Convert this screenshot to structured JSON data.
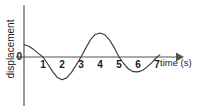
{
  "figure": {
    "kind": "line-graph",
    "background_color": "#ffffff",
    "curve_color": "#3a3a3a",
    "axis_color": "#555555",
    "text_color": "#1b1b1b"
  },
  "labels": {
    "origin": "0",
    "x_axis_title": "time (s)",
    "y_axis_title": "displacement"
  },
  "chart_data": {
    "type": "line",
    "title": "",
    "xlabel": "time (s)",
    "ylabel": "displacement",
    "xlim": [
      0,
      7.6
    ],
    "ylim": [
      -1.15,
      1.15
    ],
    "grid": false,
    "legend": null,
    "x_ticks": [
      1,
      2,
      3,
      4,
      5,
      6,
      7
    ],
    "x_tick_labels": [
      "1",
      "2",
      "3",
      "4",
      "5",
      "6",
      "7"
    ],
    "y_ticks": [
      0
    ],
    "y_tick_labels": [
      "0"
    ],
    "period_seconds": 4,
    "zero_crossings": [
      1,
      3,
      5,
      7
    ],
    "peaks": [
      {
        "x": 4,
        "y": 1.0
      }
    ],
    "troughs": [
      {
        "x": 2,
        "y": -0.95
      },
      {
        "x": 6,
        "y": -0.62
      }
    ],
    "start_point": {
      "x": 0,
      "y": 0.52
    },
    "series": [
      {
        "name": "displacement",
        "x": [
          0,
          0.25,
          0.5,
          0.75,
          1,
          1.25,
          1.5,
          1.75,
          2,
          2.25,
          2.5,
          2.75,
          3,
          3.25,
          3.5,
          3.75,
          4,
          4.25,
          4.5,
          4.75,
          5,
          5.25,
          5.5,
          5.75,
          6,
          6.25,
          6.5,
          6.75,
          7,
          7.15
        ],
        "y": [
          0.52,
          0.45,
          0.32,
          0.15,
          0.0,
          -0.29,
          -0.6,
          -0.85,
          -0.95,
          -0.87,
          -0.64,
          -0.33,
          0.0,
          0.37,
          0.72,
          0.94,
          1.0,
          0.93,
          0.71,
          0.39,
          0.0,
          -0.28,
          -0.5,
          -0.61,
          -0.62,
          -0.55,
          -0.4,
          -0.21,
          0.0,
          0.09
        ]
      }
    ]
  },
  "geometry": {
    "axis_y_px": 57,
    "axis_x_px": 24,
    "unit_px": 19,
    "amplitude_px": 24
  }
}
